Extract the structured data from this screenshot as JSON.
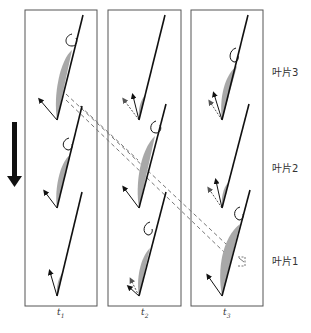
{
  "figure": {
    "panels": [
      {
        "time_label": "t",
        "time_sub": "1"
      },
      {
        "time_label": "t",
        "time_sub": "2"
      },
      {
        "time_label": "t",
        "time_sub": "3"
      }
    ],
    "blade_labels": [
      "叶片3",
      "叶片2",
      "叶片1"
    ],
    "direction_arrow": "down-arrow",
    "caption": "",
    "colors": {
      "frame": "#555555",
      "blade": "#111111",
      "separation": "#a8a8a8",
      "dashed": "#777777"
    }
  }
}
